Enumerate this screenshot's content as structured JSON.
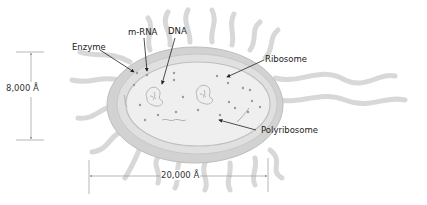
{
  "diagram": {
    "labels": {
      "enzyme": "Enzyme",
      "mrna": "m-RNA",
      "dna": "DNA",
      "ribosome": "Ribosome",
      "polyribosome": "Polyribosome"
    },
    "dimensions": {
      "height": "8,000 Å",
      "width": "20,000 Å"
    },
    "colors": {
      "cell_wall": "#c9c9c9",
      "membrane": "#dedede",
      "cytoplasm": "#ececec",
      "flagella": "#d4d4d4",
      "arrow": "#222222",
      "dimension_line": "#999999"
    }
  }
}
